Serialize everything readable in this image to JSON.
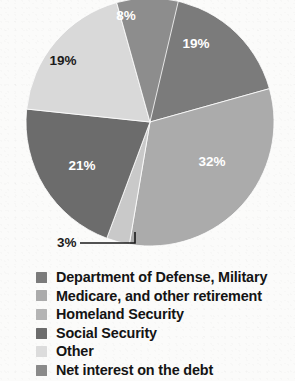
{
  "chart_data": {
    "type": "pie",
    "title": "",
    "subtitle": "",
    "xlabel": "",
    "ylabel": "",
    "grid": false,
    "legend_position": "bottom-left",
    "units": "percent",
    "categories": [
      "Department of Defense, Military",
      "Medicare, and other retirement",
      "Homeland Security",
      "Social Security",
      "Other",
      "Net interest on the debt"
    ],
    "values": [
      19,
      32,
      8,
      21,
      19,
      3
    ],
    "value_labels": [
      "19%",
      "32%",
      "8%",
      "21%",
      "19%",
      "3%"
    ],
    "colors": [
      "#7b7b7b",
      "#ababab",
      "#8d8d8d",
      "#6c6c6c",
      "#d9d9d9",
      "#c9c9c9"
    ],
    "slices": [
      {
        "name": "Department of Defense, Military",
        "label": "19%",
        "value": 19,
        "color": "#7b7b7b",
        "label_color": "light",
        "start_angle": 6,
        "end_angle": 74.4,
        "label_x": 196,
        "label_y": 48
      },
      {
        "name": "Medicare, and other retirement",
        "label": "32%",
        "value": 32,
        "color": "#ababab",
        "label_color": "light",
        "start_angle": 74.4,
        "end_angle": 189.6,
        "label_x": 212,
        "label_y": 166
      },
      {
        "name": "Net interest on the debt",
        "label": "3%",
        "value": 3,
        "color": "#c9c9c9",
        "label_color": "dark",
        "start_angle": 189.6,
        "end_angle": 200.4,
        "label_x": 75,
        "label_y": 247
      },
      {
        "name": "Social Security",
        "label": "21%",
        "value": 21,
        "color": "#6c6c6c",
        "label_color": "light",
        "start_angle": 200.4,
        "end_angle": 276,
        "label_x": 82,
        "label_y": 170
      },
      {
        "name": "Other",
        "label": "19%",
        "value": 19,
        "color": "#d9d9d9",
        "label_color": "dark",
        "start_angle": 276,
        "end_angle": 344.4,
        "label_x": 63,
        "label_y": 65
      },
      {
        "name": "Homeland Security",
        "label": "8%",
        "value": 8,
        "color": "#8d8d8d",
        "label_color": "light",
        "start_angle": 344.4,
        "end_angle": 373.2,
        "label_x": 126,
        "label_y": 20
      }
    ],
    "geometry": {
      "center_x": 150,
      "center_y": 122,
      "radius": 124
    },
    "callout": {
      "label": "3%",
      "text_x": 57,
      "text_y": 247,
      "line_x1": 80,
      "line_x2": 135,
      "line_y": 243,
      "tick_y_top": 232
    }
  },
  "legend": {
    "items": [
      {
        "label": "Department of Defense, Military",
        "color": "#7b7b7b"
      },
      {
        "label": "Medicare, and other retirement",
        "color": "#ababab"
      },
      {
        "label": "Homeland Security",
        "color": "#b4b4b4"
      },
      {
        "label": "Social Security",
        "color": "#6c6c6c"
      },
      {
        "label": "Other",
        "color": "#dcdcdc"
      },
      {
        "label": "Net interest on the debt",
        "color": "#8a8a8a"
      }
    ]
  }
}
